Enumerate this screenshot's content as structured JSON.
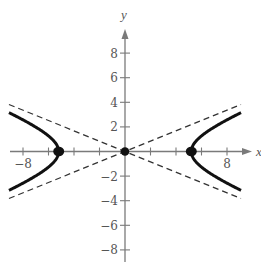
{
  "chart_data": {
    "type": "line",
    "title": "",
    "xlabel": "x",
    "ylabel": "y",
    "xlim": [
      -9.1,
      9.5
    ],
    "ylim": [
      -9,
      10
    ],
    "grid": false,
    "legend": null,
    "x_ticks": [
      -8,
      -6,
      -4,
      -2,
      2,
      4,
      6,
      8
    ],
    "y_ticks": [
      -8,
      -6,
      -4,
      -2,
      2,
      4,
      6,
      8
    ],
    "x_tick_labels": [
      {
        "value": -8,
        "label": "−8"
      },
      {
        "value": 8,
        "label": "8"
      }
    ],
    "y_tick_labels": [
      {
        "value": 8,
        "label": "8"
      },
      {
        "value": 6,
        "label": "6"
      },
      {
        "value": 4,
        "label": "4"
      },
      {
        "value": 2,
        "label": "2"
      },
      {
        "value": -2,
        "label": "−2"
      },
      {
        "value": -4,
        "label": "−4"
      },
      {
        "value": -6,
        "label": "−6"
      },
      {
        "value": -8,
        "label": "−8"
      }
    ],
    "series": [
      {
        "name": "hyperbola",
        "style": "solid-thick",
        "equation": "x^2/a^2 - y^2/b^2 = 1",
        "a": 5.2,
        "b": 2.2,
        "x_extent": 9.1
      },
      {
        "name": "asymptotes",
        "style": "dashed",
        "slopes": [
          0.42,
          -0.42
        ],
        "x_extent": 9.1
      }
    ],
    "points": [
      {
        "x": -5.2,
        "y": 0,
        "label": "vertex"
      },
      {
        "x": 0,
        "y": 0,
        "label": "center"
      },
      {
        "x": 5.2,
        "y": 0,
        "label": "vertex"
      }
    ],
    "colors": {
      "axis": "#7a7a7a",
      "curve": "#111111",
      "asymptote": "#333333",
      "text": "#555555"
    }
  }
}
